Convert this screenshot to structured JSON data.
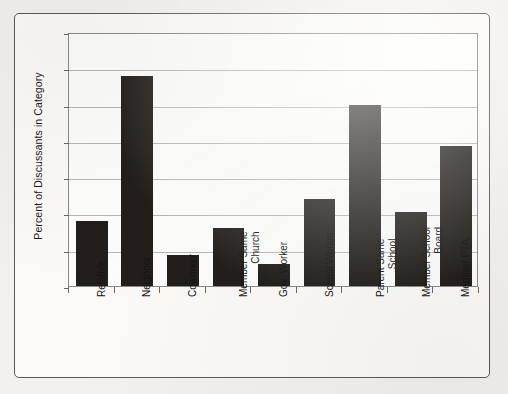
{
  "chart_data": {
    "type": "bar",
    "title": "",
    "subtitle": "",
    "xlabel": "",
    "ylabel": "Percent of Discussants in Category",
    "ylim": [
      0,
      70
    ],
    "yticks": [
      0,
      10,
      20,
      30,
      40,
      50,
      60,
      70
    ],
    "ytick_labels": [
      "0",
      "10",
      "20",
      "30",
      "40",
      "50",
      "60",
      "70"
    ],
    "grid": true,
    "legend": null,
    "legend_position": "none",
    "bar_color": "#221f1a",
    "categories": [
      "Relative",
      "Neighbor",
      "Coworker",
      "Member Same Church",
      "Gov. Worker",
      "School Worker",
      "Parent Same School",
      "Member School Board",
      "Member PTA"
    ],
    "category_label_lines": [
      [
        "Relative"
      ],
      [
        "Neighbor"
      ],
      [
        "Coworker"
      ],
      [
        "Member Same",
        "Church"
      ],
      [
        "Gov. Worker"
      ],
      [
        "School Worker"
      ],
      [
        "Parent Same",
        "School"
      ],
      [
        "Member School",
        "Board"
      ],
      [
        "Member PTA"
      ]
    ],
    "values": [
      18,
      58,
      8.5,
      16,
      6,
      24,
      50,
      20.5,
      38.5
    ]
  },
  "colors": {
    "bar": "#221f1a",
    "gridline": "#b9b7b1",
    "axis": "#8c8a85",
    "frame": "#5d5a54",
    "plot_background": "#fdfdfb",
    "page_background": "#f3f1ec",
    "text": "#141414"
  }
}
